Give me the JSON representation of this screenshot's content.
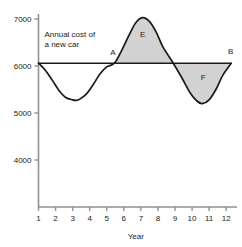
{
  "chart_data": {
    "type": "line",
    "title": "",
    "subtitle": "",
    "xlabel": "Year",
    "ylabel": "",
    "xlim": [
      1,
      12.4
    ],
    "ylim": [
      3550,
      7250
    ],
    "grid": false,
    "legend": null,
    "x_ticks": [
      "1",
      "2",
      "3",
      "4",
      "5",
      "6",
      "7",
      "8",
      "9",
      "10",
      "11",
      "12"
    ],
    "x_tick_values": [
      1,
      2,
      3,
      4,
      5,
      6,
      7,
      8,
      9,
      10,
      11,
      12
    ],
    "y_ticks": [
      "7000",
      "6000",
      "5000",
      "4000"
    ],
    "y_tick_values": [
      7000,
      6000,
      5000,
      4000
    ],
    "series": [
      {
        "name": "Annual cost of a new car",
        "type": "curve",
        "x": [
          1.0,
          1.4,
          1.8,
          2.2,
          2.6,
          3.0,
          3.2,
          3.4,
          3.8,
          4.2,
          4.6,
          5.0,
          5.45,
          5.9,
          6.3,
          6.7,
          7.1,
          7.5,
          7.9,
          8.3,
          8.9,
          9.4,
          9.9,
          10.3,
          10.6,
          11.0,
          11.4,
          11.8,
          12.3
        ],
        "y": [
          6060,
          5910,
          5700,
          5480,
          5330,
          5280,
          5270,
          5290,
          5400,
          5600,
          5830,
          5980,
          6060,
          6350,
          6650,
          6920,
          7030,
          6950,
          6720,
          6400,
          6060,
          5750,
          5420,
          5250,
          5200,
          5280,
          5500,
          5800,
          6060
        ]
      },
      {
        "name": "Reference line A to B",
        "type": "horizontal-line",
        "y": 6060,
        "x_start": 1.0,
        "x_end": 12.3
      }
    ],
    "shaded_regions": [
      {
        "label": "E",
        "description": "Area between curve and reference line above the line",
        "x_start": 5.45,
        "x_end": 8.9,
        "fill": "#d2d2d2",
        "label_x": 7.1,
        "label_y": 6620
      },
      {
        "label": "F",
        "description": "Area between curve and reference line below the line",
        "x_start": 8.9,
        "x_end": 12.3,
        "fill": "#d2d2d2",
        "label_x": 10.65,
        "label_y": 5700
      }
    ],
    "annotations": [
      {
        "name": "series-annotation-line1",
        "text": "Annual cost of",
        "x": 1.35,
        "y": 6620
      },
      {
        "name": "series-annotation-line2",
        "text": "a new car",
        "x": 1.35,
        "y": 6400
      },
      {
        "name": "point-label-a",
        "text": "A",
        "x": 5.2,
        "y": 6230
      },
      {
        "name": "point-label-b",
        "text": "B",
        "x": 12.1,
        "y": 6250
      }
    ]
  },
  "colors": {
    "background": "#ffffff",
    "axis": "#808080",
    "curve": "#1a1a1a",
    "reference_line": "#1a1a1a",
    "shade_fill": "#d2d2d2",
    "text": "#1a1a1a"
  }
}
